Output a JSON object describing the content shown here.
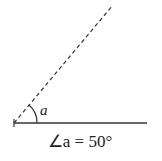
{
  "diagram": {
    "angle_label": "a",
    "caption": "∠a = 50°",
    "angle_degrees": 50,
    "colors": {
      "line": "#333333",
      "text": "#222222",
      "background": "#ffffff"
    }
  }
}
